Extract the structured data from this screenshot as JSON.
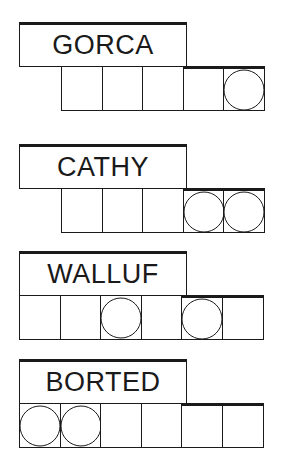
{
  "puzzles": [
    {
      "word": "GORCA",
      "cells": 5,
      "offset_cells": 1,
      "circled": [
        5
      ]
    },
    {
      "word": "CATHY",
      "cells": 5,
      "offset_cells": 1,
      "circled": [
        4,
        5
      ]
    },
    {
      "word": "WALLUF",
      "cells": 6,
      "offset_cells": 0,
      "circled": [
        3,
        5
      ]
    },
    {
      "word": "BORTED",
      "cells": 6,
      "offset_cells": 0,
      "circled": [
        1,
        2
      ]
    }
  ],
  "colors": {
    "line": "#1a1a1a",
    "background": "#ffffff"
  }
}
